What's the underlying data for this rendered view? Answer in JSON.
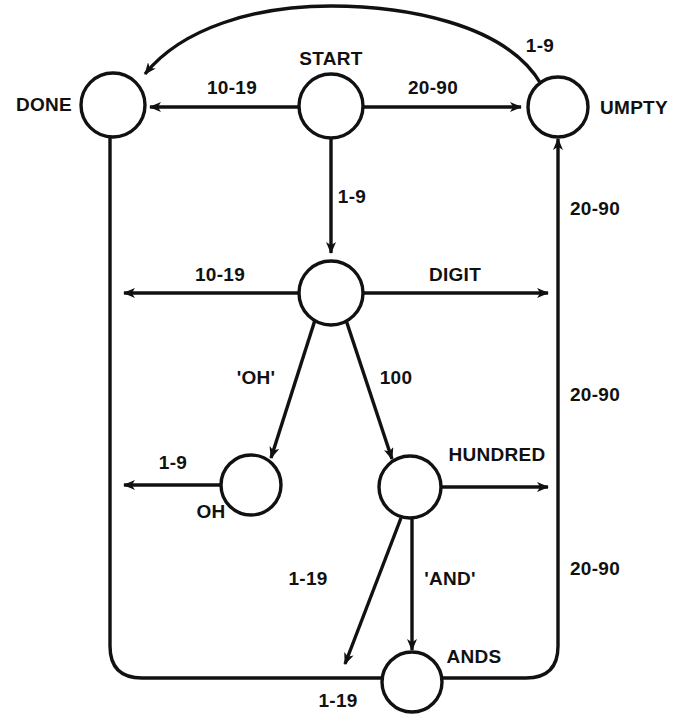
{
  "diagram": {
    "type": "finite-state-machine",
    "stroke_color": "#111111",
    "fill_color": "#ffffff",
    "background": "#ffffff",
    "nodes": [
      {
        "id": "done",
        "label": "DONE",
        "cx": 113,
        "cy": 105,
        "r": 32,
        "label_x": 72,
        "label_y": 104,
        "label_align": "r"
      },
      {
        "id": "start",
        "label": "START",
        "cx": 331,
        "cy": 106,
        "r": 32,
        "label_x": 331,
        "label_y": 58,
        "label_align": "c"
      },
      {
        "id": "umpty",
        "label": "UMPTY",
        "cx": 558,
        "cy": 107,
        "r": 30,
        "label_x": 600,
        "label_y": 107,
        "label_align": "l"
      },
      {
        "id": "digit",
        "label": "DIGIT",
        "cx": 331,
        "cy": 293,
        "r": 32,
        "label_x": 455,
        "label_y": 274,
        "label_align": "c"
      },
      {
        "id": "oh",
        "label": "OH",
        "cx": 251,
        "cy": 485,
        "r": 30,
        "label_x": 211,
        "label_y": 511,
        "label_align": "c"
      },
      {
        "id": "hundred",
        "label": "HUNDRED",
        "cx": 410,
        "cy": 487,
        "r": 31,
        "label_x": 497,
        "label_y": 454,
        "label_align": "c"
      },
      {
        "id": "ands",
        "label": "ANDS",
        "cx": 412,
        "cy": 682,
        "r": 30,
        "label_x": 474,
        "label_y": 656,
        "label_align": "c"
      }
    ],
    "edges": [
      {
        "id": "umpty-to-done-arc",
        "from": "umpty",
        "to": "done",
        "label": "1-9",
        "label_x": 540,
        "label_y": 45,
        "label_align": "c"
      },
      {
        "id": "start-to-done",
        "from": "start",
        "to": "done",
        "label": "10-19",
        "label_x": 232,
        "label_y": 87,
        "label_align": "c"
      },
      {
        "id": "start-to-umpty",
        "from": "start",
        "to": "umpty",
        "label": "20-90",
        "label_x": 433,
        "label_y": 87,
        "label_align": "c"
      },
      {
        "id": "start-to-digit",
        "from": "start",
        "to": "digit",
        "label": "1-9",
        "label_x": 352,
        "label_y": 196,
        "label_align": "c"
      },
      {
        "id": "digit-to-done",
        "from": "digit",
        "to": "done",
        "label": "10-19",
        "label_x": 220,
        "label_y": 274,
        "label_align": "c"
      },
      {
        "id": "digit-to-umpty",
        "from": "digit",
        "to": "umpty",
        "label": "20-90",
        "label_x": 597,
        "label_y": 208,
        "label_align": "l"
      },
      {
        "id": "digit-to-oh",
        "from": "digit",
        "to": "oh",
        "label": "'OH'",
        "label_x": 256,
        "label_y": 377,
        "label_align": "c"
      },
      {
        "id": "digit-to-hundred",
        "from": "digit",
        "to": "hundred",
        "label": "100",
        "label_x": 396,
        "label_y": 377,
        "label_align": "c"
      },
      {
        "id": "oh-to-done",
        "from": "oh",
        "to": "done",
        "label": "1-9",
        "label_x": 173,
        "label_y": 462,
        "label_align": "c"
      },
      {
        "id": "hundred-to-umpty",
        "from": "hundred",
        "to": "umpty",
        "label": "20-90",
        "label_x": 597,
        "label_y": 394,
        "label_align": "l"
      },
      {
        "id": "hundred-to-done",
        "from": "hundred",
        "to": "done",
        "label": "1-19",
        "label_x": 308,
        "label_y": 578,
        "label_align": "c"
      },
      {
        "id": "hundred-to-ands",
        "from": "hundred",
        "to": "ands",
        "label": "'AND'",
        "label_x": 450,
        "label_y": 578,
        "label_align": "c"
      },
      {
        "id": "ands-to-umpty",
        "from": "ands",
        "to": "umpty",
        "label": "20-90",
        "label_x": 597,
        "label_y": 568,
        "label_align": "l"
      },
      {
        "id": "ands-to-done",
        "from": "ands",
        "to": "done",
        "label": "1-19",
        "label_x": 338,
        "label_y": 700,
        "label_align": "c"
      }
    ]
  }
}
